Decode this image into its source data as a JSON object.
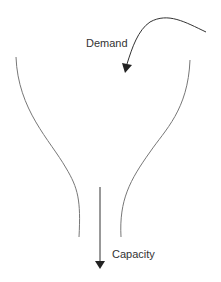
{
  "diagram": {
    "type": "funnel",
    "labels": {
      "demand": "Demand",
      "capacity": "Capacity"
    },
    "colors": {
      "background": "#ffffff",
      "funnel_stroke": "#777777",
      "arrow": "#333333",
      "text": "#333333"
    }
  }
}
